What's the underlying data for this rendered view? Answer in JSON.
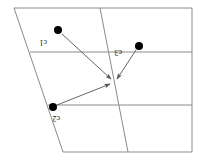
{
  "figure": {
    "canvas": {
      "width": 199,
      "height": 160
    },
    "background_color": "#ffffff",
    "line_color": "#8a8a8a",
    "arrow_color": "#555555",
    "dot_color": "#000000",
    "label_color": "#1a1a1a"
  },
  "region": {
    "name": "outer-quadrilateral",
    "vertices": [
      {
        "x": 14,
        "y": 8
      },
      {
        "x": 192,
        "y": 8
      },
      {
        "x": 192,
        "y": 152
      },
      {
        "x": 63,
        "y": 152
      }
    ]
  },
  "partitions": {
    "horizontal": [
      {
        "name": "upper-horizontal-line",
        "x1": 30,
        "y1": 52,
        "x2": 192,
        "y2": 52
      },
      {
        "name": "lower-horizontal-line",
        "x1": 48,
        "y1": 105,
        "x2": 192,
        "y2": 105
      }
    ],
    "slanted": [
      {
        "name": "slanted-divider",
        "x1": 100,
        "y1": 8,
        "x2": 128,
        "y2": 152
      }
    ]
  },
  "convergence_point": {
    "x": 114,
    "y": 81
  },
  "nodes": [
    {
      "id": "c1",
      "label": "c1",
      "dot": {
        "x": 58,
        "y": 30,
        "r": 4
      },
      "label_pos": {
        "x": 47,
        "y": 40
      },
      "arrow": {
        "x1": 62,
        "y1": 34,
        "x2": 111,
        "y2": 79
      }
    },
    {
      "id": "c3",
      "label": "c3",
      "dot": {
        "x": 139,
        "y": 46,
        "r": 4
      },
      "label_pos": {
        "x": 122,
        "y": 50
      },
      "arrow": {
        "x1": 136,
        "y1": 50,
        "x2": 117,
        "y2": 79
      }
    },
    {
      "id": "c2",
      "label": "c2",
      "dot": {
        "x": 53,
        "y": 107,
        "r": 4
      },
      "label_pos": {
        "x": 60,
        "y": 116
      },
      "arrow": {
        "x1": 57,
        "y1": 105,
        "x2": 110,
        "y2": 84
      }
    }
  ]
}
